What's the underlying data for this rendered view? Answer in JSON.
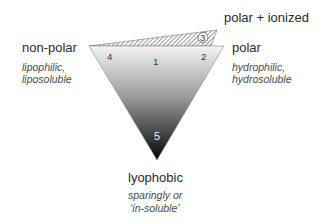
{
  "diagram": {
    "type": "solubility-triangle",
    "labels": {
      "polar_ionized": "polar + ionized",
      "non_polar": "non-polar",
      "non_polar_desc_1": "lipophilic,",
      "non_polar_desc_2": "liposoluble",
      "polar": "polar",
      "polar_desc_1": "hydrophilic,",
      "polar_desc_2": "hydrosoluble",
      "lyophobic": "lyophobic",
      "lyophobic_desc_1": "sparingly or",
      "lyophobic_desc_2": "‘in-soluble’"
    },
    "regions": [
      {
        "id": "1",
        "label": "1",
        "position": "top-center"
      },
      {
        "id": "2",
        "label": "2",
        "position": "top-right corner"
      },
      {
        "id": "3",
        "label": "3",
        "position": "hatched polar+ionized sliver",
        "circled": true
      },
      {
        "id": "4",
        "label": "4",
        "position": "top-left corner"
      },
      {
        "id": "5",
        "label": "5",
        "position": "bottom vertex"
      }
    ],
    "colors": {
      "gradient_top": "#f2f2f2",
      "gradient_bottom": "#0a0a0a",
      "hatch": "#555555",
      "text": "#2b2b2b"
    }
  }
}
